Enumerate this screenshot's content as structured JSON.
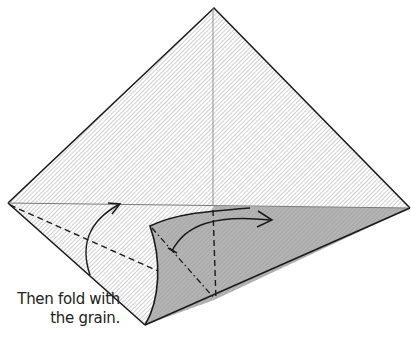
{
  "diagram": {
    "type": "origami-step",
    "caption": {
      "line1": "Then fold with",
      "line2": "the grain."
    },
    "colors": {
      "paper_hatch": "#bdbdbd",
      "paper_back": "#ffffff",
      "shaded_flap": "#a9a9a9",
      "outline": "#1a1a1a",
      "crease": "#7a7a7a"
    },
    "elements": [
      {
        "id": "upper-triangle",
        "kind": "hatched paper layer"
      },
      {
        "id": "center-crease",
        "kind": "vertical crease line"
      },
      {
        "id": "horizontal-crease",
        "kind": "horizontal edge line"
      },
      {
        "id": "lower-left-flap",
        "kind": "hatched paper layer"
      },
      {
        "id": "valley-fold-line-left",
        "kind": "dashed valley fold"
      },
      {
        "id": "curled-flap",
        "kind": "shaded paper layer"
      },
      {
        "id": "mountain-fold-line",
        "kind": "dash-dot mountain fold"
      },
      {
        "id": "valley-fold-line-vertical",
        "kind": "dashed valley fold"
      },
      {
        "id": "fold-arrow-left",
        "kind": "curved arrow"
      },
      {
        "id": "fold-arrow-right",
        "kind": "curved arrow"
      }
    ]
  }
}
